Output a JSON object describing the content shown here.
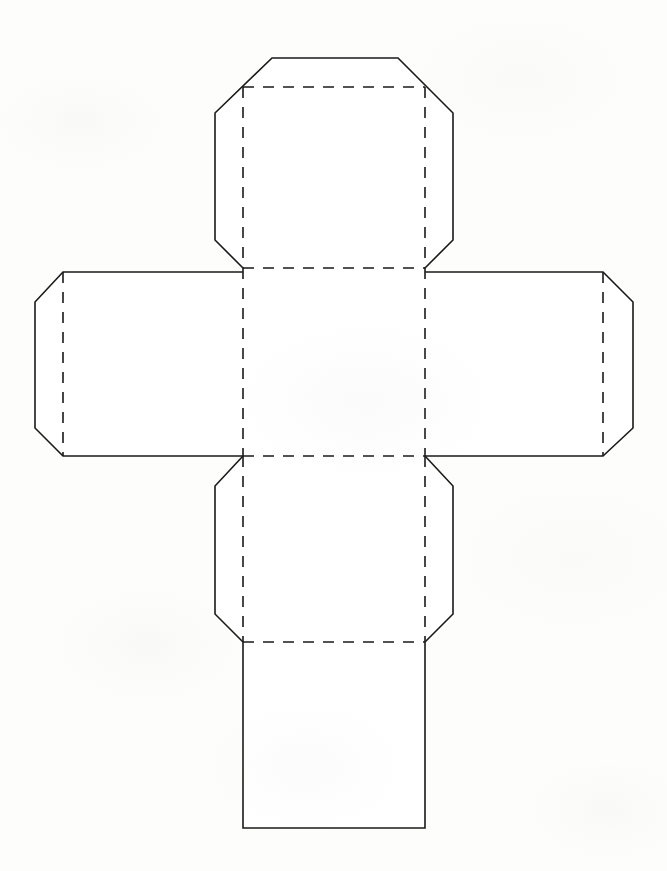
{
  "document": {
    "title": "Cube Net Template",
    "kind": "printable-craft-template",
    "background_color": "#fdfdfc",
    "ink_color": "#1a1a1a",
    "canvas": {
      "width": 667,
      "height": 871
    }
  },
  "legend": {
    "cut_line_style": "solid",
    "fold_line_style": "dashed",
    "stroke_width": 1.6,
    "dash_pattern": "11 9"
  },
  "geometry": {
    "center": {
      "x1": 243,
      "y1": 268,
      "x2": 425,
      "y2": 456
    },
    "corner_cut": 29,
    "panels": [
      {
        "name": "top-panel",
        "label": "Top Panel",
        "fold_edge": "bottom",
        "outline": "272,58 398,58 425,87 425,240 398,268 243,268 215,240 215,113 243,87",
        "cut_path": "M 243 268 L 215 240 L 215 113 L 272 58 L 398 58 L 453 113 L 453 240 L 425 268",
        "fold_path": "M 243 268 L 243 87 L 425 87 L 425 268"
      },
      {
        "name": "left-panel",
        "label": "Left Panel",
        "fold_edge": "right",
        "cut_path": "M 243 272 L 63 272 L 35 302 L 35 428 L 63 456 L 243 456",
        "fold_path": "M 63 272 L 63 456"
      },
      {
        "name": "right-panel",
        "label": "Right Panel",
        "fold_edge": "left",
        "cut_path": "M 425 272 L 603 272 L 633 302 L 633 428 L 603 456 L 425 456",
        "fold_path": "M 603 272 L 603 456"
      },
      {
        "name": "bottom-panel",
        "label": "Bottom Panel",
        "fold_edge": "top",
        "cut_path": "M 243 456 L 215 486 L 215 614 L 243 642 L 425 642 L 453 614 L 453 486 L 425 456",
        "fold_path": "M 243 642 L 425 642"
      },
      {
        "name": "base-panel",
        "label": "Base Panel",
        "fold_edge": "top",
        "cut_path": "M 243 642 L 243 828 L 425 828 L 425 642",
        "fold_path": ""
      },
      {
        "name": "center-panel",
        "label": "Center Panel",
        "fold_edge": "all",
        "cut_path": "",
        "fold_path": "M 243 268 L 425 268 L 425 456 L 243 456 Z"
      }
    ],
    "fold_lines": [
      {
        "name": "fold-center-top",
        "path": "M 243 268 L 425 268"
      },
      {
        "name": "fold-center-bottom",
        "path": "M 243 456 L 425 456"
      },
      {
        "name": "fold-center-left",
        "path": "M 243 268 L 243 456"
      },
      {
        "name": "fold-center-right",
        "path": "M 425 268 L 425 456"
      },
      {
        "name": "fold-top-flap-left",
        "path": "M 243 87 L 243 268"
      },
      {
        "name": "fold-top-flap-right",
        "path": "M 425 87 L 425 268"
      },
      {
        "name": "fold-top-flap-top",
        "path": "M 243 87 L 425 87"
      },
      {
        "name": "fold-left-flap",
        "path": "M 63 272 L 63 456"
      },
      {
        "name": "fold-right-flap",
        "path": "M 603 272 L 603 456"
      },
      {
        "name": "fold-bottom-flap-left",
        "path": "M 243 456 L 243 642"
      },
      {
        "name": "fold-bottom-flap-right",
        "path": "M 425 456 L 425 642"
      },
      {
        "name": "fold-base-top",
        "path": "M 243 642 L 425 642"
      }
    ],
    "cut_lines": [
      {
        "name": "cut-top-flap",
        "path": "M 243 268 L 215 240 L 215 113 L 243 87 L 272 58 L 398 58 L 425 87 L 453 113 L 453 240 L 425 268"
      },
      {
        "name": "cut-left-flap",
        "path": "M 243 272 L 63 272 L 35 302 L 35 428 L 63 456 L 243 456"
      },
      {
        "name": "cut-right-flap",
        "path": "M 425 272 L 603 272 L 633 302 L 633 428 L 603 456 L 425 456"
      },
      {
        "name": "cut-bottom-flap",
        "path": "M 243 456 L 215 486 L 215 614 L 243 642 L 425 642 L 453 614 L 453 486 L 425 456"
      },
      {
        "name": "cut-base-panel",
        "path": "M 243 642 L 243 828 L 425 828 L 425 642"
      }
    ]
  }
}
